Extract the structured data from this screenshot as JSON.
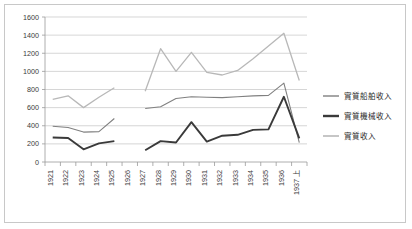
{
  "chart_data": {
    "type": "line",
    "title": "",
    "xlabel": "",
    "ylabel": "",
    "ylim": [
      0,
      1600
    ],
    "ytick_step": 200,
    "grid": true,
    "legend_position": "right",
    "categories": [
      "1921",
      "1922",
      "1923",
      "1924",
      "1925",
      "1926",
      "1927",
      "1928",
      "1929",
      "1930",
      "1931",
      "1932",
      "1933",
      "1934",
      "1935",
      "1936",
      "1937 上"
    ],
    "yticks": [
      "0",
      "200",
      "400",
      "600",
      "800",
      "1000",
      "1200",
      "1400",
      "1600"
    ],
    "series": [
      {
        "name": "實質船舶收入",
        "color": "#808080",
        "width": 1.1,
        "values": [
          395,
          380,
          330,
          335,
          480,
          null,
          590,
          610,
          700,
          720,
          715,
          710,
          720,
          730,
          735,
          870,
          215
        ]
      },
      {
        "name": "實質機械收入",
        "color": "#3a3a3a",
        "width": 1.9,
        "values": [
          270,
          265,
          140,
          205,
          230,
          null,
          130,
          230,
          215,
          440,
          225,
          290,
          300,
          355,
          360,
          720,
          260
        ]
      },
      {
        "name": "實質收入",
        "color": "#b8b8b8",
        "width": 1.3,
        "values": [
          690,
          730,
          600,
          715,
          820,
          null,
          780,
          1250,
          1000,
          1210,
          990,
          960,
          1010,
          1140,
          1280,
          1420,
          900
        ]
      }
    ]
  },
  "legend": {
    "items": [
      {
        "label": "實質船舶收入",
        "color": "#808080",
        "width": 1.4
      },
      {
        "label": "實質機械收入",
        "color": "#3a3a3a",
        "width": 2.4
      },
      {
        "label": "實質收入",
        "color": "#b8b8b8",
        "width": 1.6
      }
    ]
  },
  "frame": {
    "border_color": "#c8c8c8",
    "background": "#ffffff"
  }
}
